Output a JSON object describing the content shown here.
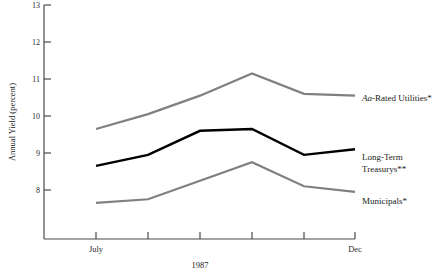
{
  "chart_data": {
    "type": "line",
    "title": "",
    "subtitle": "",
    "xlabel": "1987",
    "ylabel": "Annual Yield (percent)",
    "ylim": [
      7.3,
      13.0
    ],
    "ytick_values": [
      8,
      9,
      10,
      11,
      12,
      13
    ],
    "ytick_labels": [
      "8",
      "9",
      "10",
      "11",
      "12",
      "13"
    ],
    "x": [
      1,
      2,
      3,
      4,
      5,
      6
    ],
    "xtick_labels": [
      "July",
      "",
      "",
      "",
      "",
      "Dec"
    ],
    "xtick_visible_labels": [
      "July",
      "Dec"
    ],
    "grid": false,
    "legend_position": "right-inline",
    "series": [
      {
        "name": "Aa-Rated Utilities*",
        "label_html": "<tspan class='ital'>Aa</tspan>-Rated Utilities*",
        "color": "#808080",
        "width": 2.2,
        "values": [
          9.65,
          10.05,
          10.55,
          11.15,
          10.6,
          10.55
        ]
      },
      {
        "name": "Long-Term Treasurys**",
        "label_line1": "Long-Term",
        "label_line2": "Treasurys**",
        "color": "#000000",
        "width": 2.4,
        "values": [
          8.65,
          8.95,
          9.6,
          9.65,
          8.95,
          9.1
        ]
      },
      {
        "name": "Municipals*",
        "label_html": "Municipals*",
        "color": "#808080",
        "width": 2.2,
        "values": [
          7.65,
          7.75,
          8.25,
          8.75,
          8.1,
          7.95
        ]
      }
    ],
    "annotations": []
  },
  "axes": {
    "y_title": "Annual Yield (percent)",
    "x_title": "1987",
    "y_labels": [
      "13",
      "12",
      "11",
      "10",
      "9",
      "8"
    ],
    "x_label_left": "July",
    "x_label_right": "Dec"
  },
  "labels": {
    "utilities_prefix": "Aa",
    "utilities_rest": "-Rated Utilities*",
    "treasurys_line1": "Long-Term",
    "treasurys_line2": "Treasurys**",
    "municipals": "Municipals*"
  },
  "colors": {
    "gray_series": "#808080",
    "black_series": "#000000",
    "axis": "#4a4a4a",
    "background": "#ffffff"
  }
}
